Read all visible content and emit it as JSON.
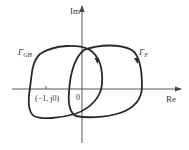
{
  "diagram": {
    "type": "nyquist-plot",
    "axes": {
      "y_label": "Im",
      "x_label": "Re",
      "origin_label": "0"
    },
    "critical_point": {
      "label": "(−1, j0)"
    },
    "curves": [
      {
        "name": "Γ",
        "subscript": "GH",
        "direction": "clockwise"
      },
      {
        "name": "Γ",
        "subscript": "F",
        "direction": "clockwise"
      }
    ],
    "colors": {
      "curve": "#2a2a2a",
      "axis": "#444444",
      "text": "#333333"
    }
  }
}
